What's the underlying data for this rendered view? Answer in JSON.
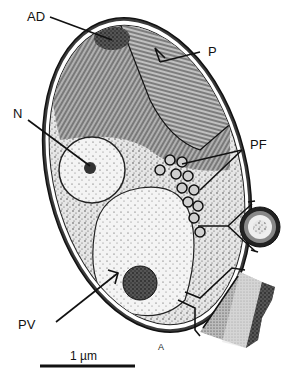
{
  "figure": {
    "type": "cell ultrastructure diagram",
    "labels": {
      "AD": "AD",
      "P": "P",
      "N": "N",
      "PF": "PF",
      "PV": "PV"
    },
    "scale_bar": {
      "text": "1 µm",
      "length_px": 98
    },
    "signature": "A",
    "insets": [
      {
        "name": "pf-cross-section-inset",
        "depicts": "circular cross-section of PF structure"
      },
      {
        "name": "wall-layers-inset",
        "depicts": "enlarged cell wall layers"
      }
    ],
    "colors": {
      "ink": "#111111",
      "background": "#ffffff",
      "stipple_light": "#d9d9d9",
      "stipple_mid": "#8a8a8a",
      "stipple_dark": "#2a2a2a"
    }
  }
}
